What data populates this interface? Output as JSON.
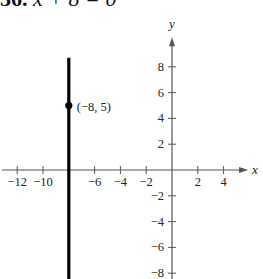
{
  "header": {
    "problem_number": "36.",
    "equation": "x + 8 = 0"
  },
  "chart_data": {
    "type": "line",
    "title": "36. x + 8 = 0",
    "xlabel": "x",
    "ylabel": "y",
    "xlim": [
      -13,
      5.5
    ],
    "ylim": [
      -8.5,
      10
    ],
    "x_ticks": [
      -12,
      -10,
      -8,
      -6,
      -4,
      -2,
      2,
      4
    ],
    "x_tick_labels": [
      "−12",
      "−10",
      "",
      "−6",
      "−4",
      "−2",
      "2",
      "4"
    ],
    "y_ticks": [
      8,
      6,
      4,
      2,
      -2,
      -4,
      -6,
      -8
    ],
    "y_tick_labels": [
      "8",
      "6",
      "4",
      "2",
      "−2",
      "−4",
      "−6",
      "−8"
    ],
    "grid": false,
    "series": [
      {
        "name": "x = -8",
        "kind": "vertical-line",
        "x": -8,
        "y_range": [
          -8.5,
          8.7
        ],
        "color": "#000000"
      }
    ],
    "points": [
      {
        "x": -8,
        "y": 5,
        "label": "(−8, 5)"
      }
    ]
  },
  "colors": {
    "line": "#000000",
    "axis": "#555555",
    "text": "#222222"
  }
}
